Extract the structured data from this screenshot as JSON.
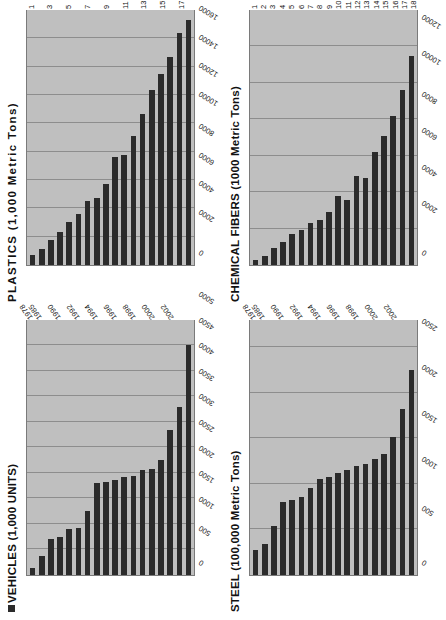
{
  "page": {
    "orientation": "rotated-landscape",
    "background": "#ffffff",
    "bar_color": "#2b2b2b",
    "plot_bg": "#bfbfbf"
  },
  "chart_data": [
    {
      "id": "plastics",
      "type": "bar",
      "orientation": "horizontal",
      "title": "PLASTICS (1,000 Metric Tons)",
      "title_spaced": true,
      "legend_marker": false,
      "xlabel": "",
      "ylabel": "",
      "value_axis_labels": [
        "0",
        "2000",
        "4000",
        "6000",
        "8000",
        "10000",
        "12000",
        "14000",
        "16000",
        "18000"
      ],
      "value_axis_ticks": [
        0,
        2000,
        4000,
        6000,
        8000,
        10000,
        12000,
        14000,
        16000,
        18000
      ],
      "ylim": [
        0,
        18000
      ],
      "grid": true,
      "categories": [
        "1",
        "2",
        "3",
        "4",
        "5",
        "6",
        "7",
        "8",
        "9",
        "10",
        "11",
        "12",
        "13",
        "14",
        "15",
        "16",
        "17",
        "18"
      ],
      "category_label_mode": "odd",
      "category_labels_shown": [
        "1",
        "3",
        "5",
        "7",
        "9",
        "11",
        "13",
        "15",
        "17"
      ],
      "values": [
        700,
        1150,
        1750,
        2350,
        3050,
        3600,
        4500,
        4700,
        5700,
        7600,
        7750,
        9100,
        10650,
        12350,
        13500,
        14650,
        16400,
        17300
      ]
    },
    {
      "id": "chemical_fibers",
      "type": "bar",
      "orientation": "horizontal",
      "title": "CHEMICAL FIBERS (1000 Metric Tons)",
      "title_spaced": false,
      "legend_marker": false,
      "xlabel": "",
      "ylabel": "",
      "value_axis_labels": [
        "0",
        "2000",
        "4000",
        "6000",
        "8000",
        "10000",
        "12000",
        "14000"
      ],
      "value_axis_ticks": [
        0,
        2000,
        4000,
        6000,
        8000,
        10000,
        12000,
        14000
      ],
      "ylim": [
        0,
        14000
      ],
      "grid": true,
      "categories": [
        "1",
        "2",
        "3",
        "4",
        "5",
        "6",
        "7",
        "8",
        "9",
        "10",
        "11",
        "12",
        "13",
        "14",
        "15",
        "16",
        "17",
        "18"
      ],
      "category_label_mode": "all",
      "category_labels_shown": [
        "1",
        "2",
        "3",
        "4",
        "5",
        "6",
        "7",
        "8",
        "9",
        "10",
        "11",
        "12",
        "13",
        "14",
        "15",
        "16",
        "17",
        "18"
      ],
      "values": [
        250,
        500,
        950,
        1250,
        1700,
        1900,
        2300,
        2450,
        2900,
        3800,
        3550,
        4900,
        4750,
        6200,
        7100,
        8200,
        9600,
        11500
      ]
    },
    {
      "id": "vehicles",
      "type": "bar",
      "orientation": "horizontal",
      "title": "VEHICLES (1,000 UNITS)",
      "title_spaced": false,
      "legend_marker": true,
      "xlabel": "",
      "ylabel": "",
      "value_axis_labels": [
        "0",
        "500",
        "1000",
        "1500",
        "2000",
        "2500",
        "3000",
        "3500",
        "4000",
        "4500",
        "5000"
      ],
      "value_axis_ticks": [
        0,
        500,
        1000,
        1500,
        2000,
        2500,
        3000,
        3500,
        4000,
        4500,
        5000
      ],
      "ylim": [
        0,
        5000
      ],
      "grid": true,
      "categories": [
        "1978",
        "1985",
        "1986",
        "1990",
        "1991",
        "1992",
        "1993",
        "1994",
        "1995",
        "1996",
        "1997",
        "1998",
        "1999",
        "2000",
        "2001",
        "2002",
        "2003",
        "2004"
      ],
      "category_label_mode": "years",
      "category_labels_shown": [
        "1978",
        "1985",
        "1990",
        "1992",
        "1994",
        "1996",
        "1998",
        "2000",
        "2002"
      ],
      "values": [
        140,
        380,
        700,
        740,
        900,
        920,
        1260,
        1800,
        1820,
        1870,
        1920,
        1950,
        2050,
        2080,
        2250,
        2850,
        3300,
        4500
      ]
    },
    {
      "id": "steel",
      "type": "bar",
      "orientation": "horizontal",
      "title": "STEEL (100,000 Metric Tons)",
      "title_spaced": false,
      "legend_marker": false,
      "xlabel": "",
      "ylabel": "",
      "value_axis_labels": [
        "0",
        "500",
        "1000",
        "1500",
        "2000",
        "2500"
      ],
      "value_axis_ticks": [
        0,
        500,
        1000,
        1500,
        2000,
        2500
      ],
      "ylim": [
        0,
        2800
      ],
      "grid": true,
      "categories": [
        "1978",
        "1985",
        "1986",
        "1990",
        "1991",
        "1992",
        "1993",
        "1994",
        "1995",
        "1996",
        "1997",
        "1998",
        "1999",
        "2000",
        "2001",
        "2002",
        "2003",
        "2004"
      ],
      "category_label_mode": "years",
      "category_labels_shown": [
        "1978",
        "1985",
        "1990",
        "1992",
        "1994",
        "1996",
        "1998",
        "2000",
        "2002"
      ],
      "values": [
        270,
        340,
        540,
        800,
        820,
        860,
        950,
        1050,
        1080,
        1120,
        1150,
        1200,
        1220,
        1270,
        1330,
        1520,
        1820,
        2250
      ]
    }
  ]
}
